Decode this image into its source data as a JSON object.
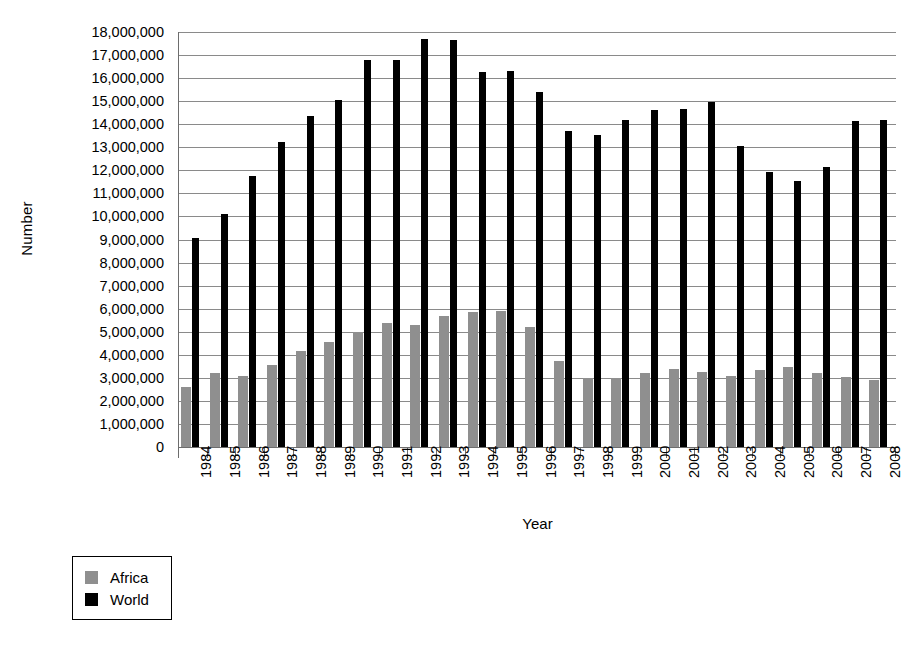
{
  "chart_data": {
    "type": "bar",
    "title": "",
    "xlabel": "Year",
    "ylabel": "Number",
    "grid": true,
    "legend_position": "bottom-left",
    "ylim": [
      0,
      18000000
    ],
    "ytick_step": 1000000,
    "ytick_labels": [
      "18,000,000",
      "17,000,000",
      "16,000,000",
      "15,000,000",
      "14,000,000",
      "13,000,000",
      "12,000,000",
      "11,000,000",
      "10,000,000",
      "9,000,000",
      "8,000,000",
      "7,000,000",
      "6,000,000",
      "5,000,000",
      "4,000,000",
      "3,000,000",
      "2,000,000",
      "1,000,000",
      "0"
    ],
    "categories": [
      "1984",
      "1985",
      "1986",
      "1987",
      "1988",
      "1989",
      "1990",
      "1991",
      "1992",
      "1993",
      "1994",
      "1995",
      "1996",
      "1997",
      "1998",
      "1999",
      "2000",
      "2001",
      "2002",
      "2003",
      "2004",
      "2005",
      "2006",
      "2007",
      "2008"
    ],
    "series": [
      {
        "name": "Africa",
        "color": "#8f8f8f",
        "values": [
          2600000,
          3200000,
          3100000,
          3550000,
          4150000,
          4550000,
          0,
          5400000,
          5300000,
          5700000,
          5850000,
          5900000,
          5200000,
          3750000,
          3000000,
          3000000,
          3200000,
          3400000,
          0,
          3100000,
          3350000,
          3450000,
          3200000,
          3050000,
          2900000
        ]
      },
      {
        "name": "World",
        "color": "#000000",
        "values": [
          9050000,
          10100000,
          11750000,
          13250000,
          14350000,
          15050000,
          16800000,
          16800000,
          17700000,
          17650000,
          16250000,
          16300000,
          15400000,
          13700000,
          13550000,
          14200000,
          14600000,
          14650000,
          14950000,
          13050000,
          11950000,
          11550000,
          12150000,
          14150000,
          14200000
        ]
      }
    ]
  },
  "legend": {
    "items": [
      {
        "label": "Africa",
        "color": "#8f8f8f"
      },
      {
        "label": "World",
        "color": "#000000"
      }
    ]
  }
}
